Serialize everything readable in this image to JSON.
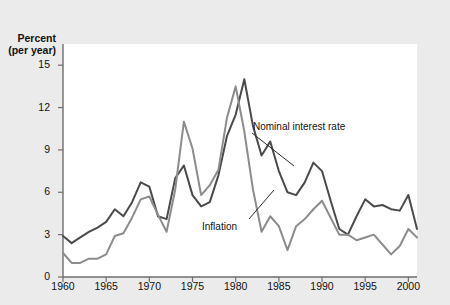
{
  "figure": {
    "background_color": "#ebebeb",
    "plot_background_color": "#ffffff",
    "axis_color": "#6e6e6e"
  },
  "axes": {
    "y_title_line1": "Percent",
    "y_title_line2": "(per year)",
    "x_title": ""
  },
  "labels": {
    "nominal": "Nominal interest rate",
    "inflation": "Inflation"
  },
  "chart_data": {
    "type": "line",
    "title": "",
    "xlabel": "",
    "ylabel": "Percent (per year)",
    "xlim": [
      1960,
      2001
    ],
    "ylim": [
      0,
      16.5
    ],
    "xticks": [
      1960,
      1965,
      1970,
      1975,
      1980,
      1985,
      1990,
      1995,
      2000
    ],
    "yticks": [
      0,
      3,
      6,
      9,
      12,
      15
    ],
    "ytick_labels": [
      "0",
      "3",
      "6",
      "9",
      "12",
      "15"
    ],
    "xtick_labels": [
      "1960",
      "1965",
      "1970",
      "1975",
      "1980",
      "1985",
      "1990",
      "1995",
      "2000"
    ],
    "grid": false,
    "legend": "inline-annotations",
    "x": [
      1960,
      1961,
      1962,
      1963,
      1964,
      1965,
      1966,
      1967,
      1968,
      1969,
      1970,
      1971,
      1972,
      1973,
      1974,
      1975,
      1976,
      1977,
      1978,
      1979,
      1980,
      1981,
      1982,
      1983,
      1984,
      1985,
      1986,
      1987,
      1988,
      1989,
      1990,
      1991,
      1992,
      1993,
      1994,
      1995,
      1996,
      1997,
      1998,
      1999,
      2000,
      2001
    ],
    "series": [
      {
        "name": "Nominal interest rate",
        "color": "#4a4a4a",
        "values": [
          2.9,
          2.4,
          2.8,
          3.2,
          3.5,
          3.9,
          4.8,
          4.3,
          5.3,
          6.7,
          6.4,
          4.3,
          4.1,
          7.0,
          7.9,
          5.8,
          5.0,
          5.3,
          7.2,
          10.0,
          11.5,
          14.0,
          10.7,
          8.6,
          9.6,
          7.5,
          6.0,
          5.8,
          6.7,
          8.1,
          7.5,
          5.4,
          3.4,
          3.0,
          4.3,
          5.5,
          5.0,
          5.1,
          4.8,
          4.7,
          5.8,
          3.4
        ]
      },
      {
        "name": "Inflation",
        "color": "#8c8c8c",
        "values": [
          1.7,
          1.0,
          1.0,
          1.3,
          1.3,
          1.6,
          2.9,
          3.1,
          4.2,
          5.5,
          5.7,
          4.4,
          3.2,
          6.2,
          11.0,
          9.1,
          5.8,
          6.5,
          7.6,
          11.3,
          13.5,
          10.3,
          6.2,
          3.2,
          4.3,
          3.6,
          1.9,
          3.6,
          4.1,
          4.8,
          5.4,
          4.2,
          3.0,
          3.0,
          2.6,
          2.8,
          3.0,
          2.3,
          1.6,
          2.2,
          3.4,
          2.8
        ]
      }
    ]
  }
}
